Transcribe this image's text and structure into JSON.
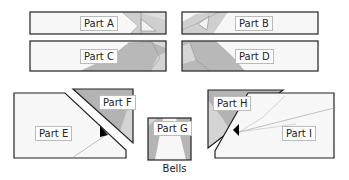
{
  "caption": "Bells",
  "colors": {
    "outline": "#222222",
    "fill_light": "#f7f7f7",
    "fill_mid": "#d0d0d0",
    "fill_dark": "#a9a9a9",
    "line_thin": "#8a8a8a"
  },
  "parts": [
    {
      "id": "A",
      "label": "Part A"
    },
    {
      "id": "B",
      "label": "Part B"
    },
    {
      "id": "C",
      "label": "Part C"
    },
    {
      "id": "D",
      "label": "Part D"
    },
    {
      "id": "E",
      "label": "Part E"
    },
    {
      "id": "F",
      "label": "Part F"
    },
    {
      "id": "G",
      "label": "Part G"
    },
    {
      "id": "H",
      "label": "Part H"
    },
    {
      "id": "I",
      "label": "Part I"
    }
  ]
}
